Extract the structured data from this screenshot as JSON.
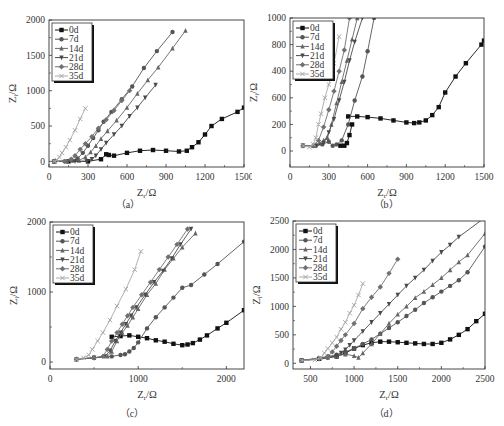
{
  "figure": {
    "captions": [
      "（a）",
      "（b）",
      "（c）",
      "（d）"
    ]
  },
  "legend": [
    "0d",
    "7d",
    "14d",
    "21d",
    "28d",
    "35d"
  ],
  "series_style": {
    "0d": {
      "color": "#111111",
      "marker": "square"
    },
    "7d": {
      "color": "#555555",
      "marker": "circle"
    },
    "14d": {
      "color": "#666666",
      "marker": "triangle"
    },
    "21d": {
      "color": "#4a4a4a",
      "marker": "tri-down"
    },
    "28d": {
      "color": "#707070",
      "marker": "diamond"
    },
    "35d": {
      "color": "#a8a8a8",
      "marker": "x"
    }
  },
  "chart_data": [
    {
      "type": "line",
      "panel": "a",
      "caption": "（a）",
      "xlabel": "Zr/Ω",
      "ylabel": "Zi/Ω",
      "xlim": [
        0,
        1500
      ],
      "ylim": [
        -80,
        2000
      ],
      "xticks": [
        0,
        300,
        600,
        900,
        1200,
        1500
      ],
      "yticks": [
        0,
        500,
        1000,
        1500,
        2000
      ],
      "ytick_labels": [
        "0",
        "500",
        "1000",
        "1500",
        "2000"
      ],
      "frame": {
        "x": 49,
        "y": 20,
        "w": 195,
        "h": 147
      },
      "series": [
        {
          "name": "0d",
          "x": [
            40,
            150,
            300,
            400,
            440,
            460,
            500,
            600,
            700,
            800,
            900,
            1000,
            1060,
            1100,
            1150,
            1200,
            1250,
            1330,
            1450,
            1500
          ],
          "y": [
            0,
            0,
            0,
            30,
            100,
            90,
            80,
            120,
            150,
            160,
            150,
            140,
            150,
            200,
            270,
            380,
            500,
            600,
            700,
            760
          ]
        },
        {
          "name": "7d",
          "x": [
            40,
            120,
            180,
            220,
            260,
            300,
            340,
            380,
            420,
            480,
            560,
            640,
            730,
            830,
            950
          ],
          "y": [
            0,
            0,
            10,
            40,
            120,
            220,
            330,
            440,
            560,
            700,
            880,
            1060,
            1320,
            1560,
            1830
          ]
        },
        {
          "name": "14d",
          "x": [
            40,
            140,
            230,
            280,
            320,
            360,
            400,
            450,
            520,
            600,
            680,
            760,
            840,
            950,
            1050
          ],
          "y": [
            0,
            0,
            10,
            60,
            130,
            220,
            320,
            430,
            580,
            760,
            960,
            1150,
            1330,
            1600,
            1850
          ]
        },
        {
          "name": "21d",
          "x": [
            40,
            200,
            290,
            330,
            360,
            400,
            440,
            500,
            560,
            620,
            680,
            740,
            820
          ],
          "y": [
            0,
            0,
            0,
            30,
            80,
            170,
            260,
            380,
            500,
            640,
            760,
            900,
            1080
          ]
        },
        {
          "name": "28d",
          "x": [
            40,
            120,
            170,
            200,
            240,
            280,
            330,
            380,
            440,
            500,
            560,
            620
          ],
          "y": [
            0,
            0,
            30,
            80,
            170,
            250,
            350,
            470,
            590,
            720,
            860,
            1000
          ]
        },
        {
          "name": "35d",
          "x": [
            40,
            60,
            80,
            100,
            130,
            160,
            200,
            240,
            280
          ],
          "y": [
            0,
            20,
            60,
            120,
            200,
            300,
            440,
            600,
            750
          ]
        }
      ]
    },
    {
      "type": "line",
      "panel": "b",
      "caption": "（b）",
      "xlabel": "Zr/Ω",
      "ylabel": "Zi/Ω",
      "xlim": [
        0,
        1500
      ],
      "ylim": [
        -120,
        1000
      ],
      "xticks": [
        0,
        300,
        600,
        900,
        1200,
        1500
      ],
      "yticks": [
        0,
        200,
        400,
        600,
        800,
        1000
      ],
      "ytick_labels": [
        "0",
        "200",
        "600",
        "400",
        "800",
        "1000"
      ],
      "frame": {
        "x": 290,
        "y": 18,
        "w": 194,
        "h": 149
      },
      "series": [
        {
          "name": "0d",
          "x": [
            450,
            520,
            600,
            700,
            800,
            900,
            960,
            1000,
            1050,
            1100,
            1150,
            1200,
            1280,
            1360,
            1480,
            1500
          ],
          "y": [
            260,
            260,
            255,
            245,
            230,
            215,
            210,
            215,
            230,
            270,
            330,
            440,
            560,
            660,
            800,
            830
          ]
        },
        {
          "name": "7d",
          "x": [
            100,
            200,
            250,
            300,
            330,
            360,
            400,
            450,
            500,
            560,
            600,
            650
          ],
          "y": [
            40,
            40,
            50,
            70,
            40,
            50,
            80,
            200,
            380,
            560,
            750,
            1000
          ]
        },
        {
          "name": "14d",
          "x": [
            100,
            180,
            230,
            260,
            290,
            320,
            360,
            400,
            440,
            480,
            520
          ],
          "y": [
            40,
            40,
            60,
            80,
            100,
            200,
            360,
            520,
            680,
            840,
            1000
          ]
        },
        {
          "name": "21d",
          "x": [
            100,
            200,
            260,
            300,
            340,
            380,
            420,
            460,
            500,
            560
          ],
          "y": [
            40,
            40,
            60,
            140,
            240,
            380,
            520,
            680,
            820,
            1000
          ]
        },
        {
          "name": "28d",
          "x": [
            100,
            180,
            220,
            260,
            300,
            340,
            380,
            420,
            460
          ],
          "y": [
            40,
            40,
            80,
            180,
            310,
            450,
            600,
            760,
            1000
          ]
        },
        {
          "name": "35d",
          "x": [
            100,
            150,
            180,
            200,
            220,
            240,
            270,
            300,
            340,
            380
          ],
          "y": [
            40,
            30,
            50,
            100,
            200,
            280,
            400,
            500,
            660,
            860
          ]
        },
        {
          "name": "0d-tail",
          "x": [
            390,
            420,
            440,
            460,
            480
          ],
          "y": [
            40,
            40,
            60,
            120,
            200
          ]
        }
      ]
    },
    {
      "type": "line",
      "panel": "c",
      "caption": "（c）",
      "xlabel": "Zr/Ω",
      "ylabel": "Zi/Ω",
      "xlim": [
        0,
        2200
      ],
      "ylim": [
        -100,
        2000
      ],
      "xticks": [
        0,
        1000,
        2000
      ],
      "yticks": [
        0,
        1000,
        2000
      ],
      "ytick_labels": [
        "0",
        "1000",
        "2000"
      ],
      "frame": {
        "x": 50,
        "y": 222,
        "w": 194,
        "h": 147
      },
      "series": [
        {
          "name": "0d",
          "x": [
            700,
            800,
            900,
            1000,
            1100,
            1200,
            1300,
            1400,
            1500,
            1560,
            1620,
            1700,
            1780,
            1900,
            2000,
            2200
          ],
          "y": [
            360,
            370,
            380,
            360,
            340,
            310,
            290,
            260,
            240,
            250,
            270,
            320,
            380,
            480,
            560,
            740
          ]
        },
        {
          "name": "7d",
          "x": [
            300,
            500,
            700,
            800,
            850,
            900,
            950,
            1000,
            1100,
            1200,
            1300,
            1400,
            1500,
            1600,
            1750,
            1900,
            2200
          ],
          "y": [
            40,
            60,
            80,
            100,
            110,
            150,
            200,
            280,
            480,
            640,
            780,
            920,
            1060,
            1100,
            1250,
            1400,
            1720
          ]
        },
        {
          "name": "14d",
          "x": [
            300,
            500,
            650,
            700,
            760,
            820,
            880,
            940,
            1000,
            1100,
            1200,
            1300,
            1400,
            1500,
            1650
          ],
          "y": [
            40,
            60,
            80,
            150,
            300,
            420,
            520,
            640,
            760,
            960,
            1120,
            1320,
            1480,
            1640,
            1840
          ]
        },
        {
          "name": "21d",
          "x": [
            300,
            500,
            620,
            680,
            740,
            800,
            860,
            920,
            980,
            1080,
            1180,
            1280,
            1380,
            1480,
            1600
          ],
          "y": [
            40,
            60,
            80,
            160,
            300,
            420,
            540,
            660,
            780,
            960,
            1140,
            1300,
            1480,
            1680,
            1900
          ]
        },
        {
          "name": "28d",
          "x": [
            300,
            500,
            600,
            650,
            700,
            760,
            820,
            880,
            940,
            1040,
            1140,
            1240,
            1340,
            1440,
            1560
          ],
          "y": [
            40,
            60,
            80,
            180,
            300,
            420,
            540,
            660,
            780,
            960,
            1140,
            1320,
            1500,
            1680,
            1900
          ]
        },
        {
          "name": "35d",
          "x": [
            300,
            380,
            440,
            480,
            540,
            600,
            680,
            760,
            860,
            960,
            1030
          ],
          "y": [
            40,
            60,
            100,
            180,
            300,
            420,
            600,
            800,
            1040,
            1320,
            1580
          ]
        }
      ]
    },
    {
      "type": "line",
      "panel": "d",
      "caption": "（d）",
      "xlabel": "Zr/Ω",
      "ylabel": "Zi/Ω",
      "xlim": [
        300,
        2500
      ],
      "ylim": [
        -100,
        2500
      ],
      "xticks": [
        500,
        1000,
        1500,
        2000,
        2500
      ],
      "yticks": [
        0,
        500,
        1000,
        1500,
        2000,
        2500
      ],
      "ytick_labels": [
        "0",
        "500",
        "1000",
        "1500",
        "2000",
        "2500"
      ],
      "frame": {
        "x": 293,
        "y": 221,
        "w": 192,
        "h": 148
      },
      "series": [
        {
          "name": "0d",
          "x": [
            400,
            600,
            800,
            900,
            1000,
            1100,
            1200,
            1300,
            1400,
            1500,
            1600,
            1700,
            1800,
            1900,
            2000,
            2100,
            2200,
            2300,
            2400,
            2500
          ],
          "y": [
            50,
            80,
            120,
            180,
            260,
            320,
            360,
            380,
            380,
            370,
            360,
            350,
            340,
            340,
            360,
            420,
            500,
            600,
            740,
            870
          ]
        },
        {
          "name": "7d",
          "x": [
            400,
            700,
            800,
            900,
            1000,
            1100,
            1200,
            1300,
            1400,
            1500,
            1600,
            1700,
            1800,
            1900,
            2000,
            2100,
            2200,
            2300,
            2500
          ],
          "y": [
            50,
            120,
            150,
            200,
            260,
            340,
            420,
            520,
            620,
            720,
            830,
            940,
            1060,
            1160,
            1260,
            1360,
            1460,
            1600,
            2050
          ]
        },
        {
          "name": "14d",
          "x": [
            400,
            700,
            800,
            900,
            1000,
            1050,
            1100,
            1200,
            1300,
            1400,
            1500,
            1600,
            1700,
            1800,
            1900,
            2000,
            2100,
            2200,
            2300,
            2500
          ],
          "y": [
            50,
            100,
            130,
            160,
            130,
            100,
            180,
            340,
            520,
            700,
            860,
            1000,
            1150,
            1260,
            1380,
            1500,
            1640,
            1780,
            1900,
            2280
          ]
        },
        {
          "name": "21d",
          "x": [
            400,
            700,
            800,
            850,
            900,
            950,
            1000,
            1100,
            1200,
            1300,
            1400,
            1500,
            1600,
            1700,
            1800,
            1900,
            2000,
            2100,
            2200,
            2500
          ],
          "y": [
            50,
            100,
            130,
            180,
            240,
            320,
            400,
            560,
            720,
            880,
            1040,
            1200,
            1360,
            1500,
            1640,
            1800,
            1950,
            2080,
            2220,
            2560
          ]
        },
        {
          "name": "28d",
          "x": [
            400,
            600,
            700,
            750,
            800,
            850,
            900,
            1000,
            1100,
            1200,
            1300,
            1400,
            1500
          ],
          "y": [
            50,
            80,
            120,
            200,
            300,
            400,
            500,
            700,
            960,
            1160,
            1340,
            1580,
            1830
          ]
        },
        {
          "name": "35d",
          "x": [
            400,
            550,
            620,
            660,
            700,
            750,
            800,
            850,
            900,
            950,
            1000,
            1050,
            1100
          ],
          "y": [
            50,
            60,
            100,
            180,
            260,
            360,
            460,
            600,
            720,
            880,
            1020,
            1200,
            1400
          ]
        }
      ]
    }
  ]
}
